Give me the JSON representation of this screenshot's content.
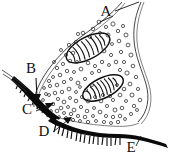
{
  "figure": {
    "background_color": "#ffffff",
    "ink_color": "#0a0a0a",
    "width": 174,
    "height": 160
  },
  "labels": [
    {
      "id": "A",
      "text": "A",
      "x": 106,
      "y": 16,
      "points_to": "presynaptic-terminal-membrane"
    },
    {
      "id": "B",
      "text": "B",
      "x": 31,
      "y": 73,
      "points_to": "presynaptic-membrane-dark-band"
    },
    {
      "id": "C",
      "text": "C",
      "x": 27,
      "y": 114,
      "points_to": "synaptic-cleft"
    },
    {
      "id": "D",
      "text": "D",
      "x": 44,
      "y": 136,
      "points_to": "postsynaptic-membrane-folds"
    },
    {
      "id": "E",
      "text": "E",
      "x": 131,
      "y": 152,
      "points_to": "postsynaptic-muscle-membrane"
    }
  ],
  "structures": {
    "presynaptic_terminal": {
      "name": "presynaptic terminal bouton",
      "outline_color": "#303030"
    },
    "mitochondria": [
      {
        "name": "mitochondrion-upper",
        "cx": 88,
        "cy": 48,
        "rx": 24,
        "ry": 11,
        "rotation": -28,
        "cristae_count": 9
      },
      {
        "name": "mitochondrion-lower",
        "cx": 103,
        "cy": 88,
        "rx": 22,
        "ry": 10,
        "rotation": -26,
        "cristae_count": 8
      }
    ],
    "synaptic_vesicles": {
      "name": "synaptic vesicles",
      "count": 118,
      "radius_range": [
        1.2,
        2.6
      ],
      "dense_zone": "near active zone above synaptic cleft"
    },
    "synaptic_cleft": {
      "name": "synaptic cleft",
      "color": "#ffffff"
    },
    "postsynaptic_membrane": {
      "name": "postsynaptic membrane with junctional folds",
      "color": "#0a0a0a",
      "fold_count": 26
    }
  }
}
